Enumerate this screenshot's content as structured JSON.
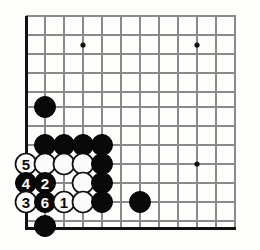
{
  "figure": {
    "type": "go-board-diagram",
    "board_size": 19,
    "view": "lower-left corner"
  },
  "board": {
    "background_color": "#fdfdfb",
    "grid_color": "#8a8a8a",
    "edge_color": "#111111",
    "black_stone_color": "#090909",
    "white_stone_color": "#fbfbfb",
    "label_black_text_color": "#ffffff",
    "label_white_text_color": "#0a0a0a",
    "grid_spacing_px": 19,
    "stone_radius_px": 10.5,
    "origin_x_px": 26,
    "origin_y_px": 16,
    "columns_px": [
      26,
      45,
      64,
      83,
      102,
      121,
      140,
      159,
      178,
      197,
      216,
      235
    ],
    "rows_px": [
      16,
      35,
      54,
      73,
      92,
      107,
      126,
      145,
      164,
      183,
      202,
      221
    ],
    "left_edge_x_px": 26,
    "bottom_edge_y_px": 228,
    "grid_right_x_px": 236,
    "grid_top_y_px": 16
  },
  "star_points": [
    {
      "name": "star-point-upper-left",
      "x": 83,
      "y": 45
    },
    {
      "name": "star-point-upper-right",
      "x": 197,
      "y": 45
    },
    {
      "name": "star-point-center-right",
      "x": 197,
      "y": 164
    }
  ],
  "stones": [
    {
      "name": "stone-black-a",
      "color": "black",
      "x": 45,
      "y": 107,
      "label": ""
    },
    {
      "name": "stone-black-b",
      "color": "black",
      "x": 45,
      "y": 145,
      "label": ""
    },
    {
      "name": "stone-black-c",
      "color": "black",
      "x": 64,
      "y": 145,
      "label": ""
    },
    {
      "name": "stone-black-d",
      "color": "black",
      "x": 83,
      "y": 145,
      "label": ""
    },
    {
      "name": "stone-black-e",
      "color": "black",
      "x": 102,
      "y": 145,
      "label": ""
    },
    {
      "name": "stone-white-move-5",
      "color": "white",
      "x": 26,
      "y": 164,
      "label": "5"
    },
    {
      "name": "stone-white-f",
      "color": "white",
      "x": 45,
      "y": 164,
      "label": ""
    },
    {
      "name": "stone-white-g",
      "color": "white",
      "x": 64,
      "y": 164,
      "label": ""
    },
    {
      "name": "stone-white-h",
      "color": "white",
      "x": 83,
      "y": 164,
      "label": ""
    },
    {
      "name": "stone-black-i",
      "color": "black",
      "x": 102,
      "y": 164,
      "label": ""
    },
    {
      "name": "stone-black-move-4",
      "color": "black",
      "x": 26,
      "y": 183,
      "label": "4"
    },
    {
      "name": "stone-black-move-2",
      "color": "black",
      "x": 45,
      "y": 183,
      "label": "2"
    },
    {
      "name": "stone-white-j",
      "color": "white",
      "x": 83,
      "y": 183,
      "label": ""
    },
    {
      "name": "stone-black-k",
      "color": "black",
      "x": 102,
      "y": 183,
      "label": ""
    },
    {
      "name": "stone-white-move-3",
      "color": "white",
      "x": 26,
      "y": 202,
      "label": "3"
    },
    {
      "name": "stone-black-move-6",
      "color": "black",
      "x": 45,
      "y": 202,
      "label": "6"
    },
    {
      "name": "stone-white-move-1",
      "color": "white",
      "x": 64,
      "y": 202,
      "label": "1"
    },
    {
      "name": "stone-white-l",
      "color": "white",
      "x": 83,
      "y": 202,
      "label": ""
    },
    {
      "name": "stone-black-m",
      "color": "black",
      "x": 102,
      "y": 202,
      "label": ""
    },
    {
      "name": "stone-black-n",
      "color": "black",
      "x": 140,
      "y": 202,
      "label": ""
    },
    {
      "name": "stone-black-o",
      "color": "black",
      "x": 45,
      "y": 226,
      "label": ""
    }
  ],
  "move_sequence": [
    {
      "number": "1",
      "color": "white"
    },
    {
      "number": "2",
      "color": "black"
    },
    {
      "number": "3",
      "color": "white"
    },
    {
      "number": "4",
      "color": "black"
    },
    {
      "number": "5",
      "color": "white"
    },
    {
      "number": "6",
      "color": "black"
    }
  ]
}
